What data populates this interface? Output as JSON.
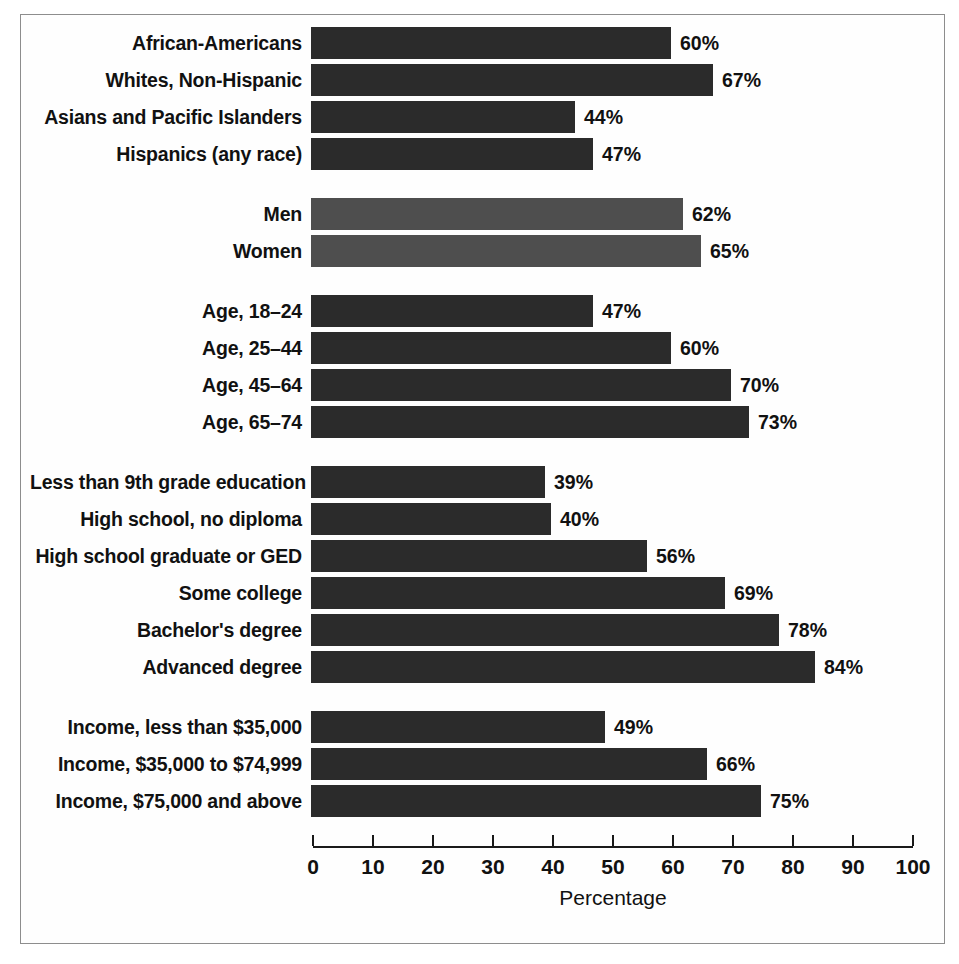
{
  "chart_data": {
    "type": "bar",
    "orientation": "horizontal",
    "title": "",
    "xlabel": "Percentage",
    "ylabel": "",
    "xlim": [
      0,
      100
    ],
    "xticks": [
      0,
      10,
      20,
      30,
      40,
      50,
      60,
      70,
      80,
      90,
      100
    ],
    "xtick_labels": [
      "0",
      "10",
      "20",
      "30",
      "40",
      "50",
      "60",
      "70",
      "80",
      "90",
      "100"
    ],
    "grid": false,
    "legend": null,
    "value_label_suffix": "%",
    "colors": {
      "bar_dark": "#2b2b2b",
      "bar_light": "#4e4e4e",
      "text": "#111111",
      "axis": "#1a1a1a",
      "frame": "#8d8d8d",
      "background": "#ffffff"
    },
    "groups": [
      {
        "name": "race-ethnicity",
        "shade": "dark",
        "categories": [
          "African-Americans",
          "Whites, Non-Hispanic",
          "Asians and Pacific Islanders",
          "Hispanics (any race)"
        ],
        "values": [
          60,
          67,
          44,
          47
        ],
        "value_labels": [
          "60%",
          "67%",
          "44%",
          "47%"
        ]
      },
      {
        "name": "sex",
        "shade": "light",
        "categories": [
          "Men",
          "Women"
        ],
        "values": [
          62,
          65
        ],
        "value_labels": [
          "62%",
          "65%"
        ]
      },
      {
        "name": "age",
        "shade": "dark",
        "categories": [
          "Age, 18–24",
          "Age, 25–44",
          "Age, 45–64",
          "Age, 65–74"
        ],
        "values": [
          47,
          60,
          70,
          73
        ],
        "value_labels": [
          "47%",
          "60%",
          "70%",
          "73%"
        ]
      },
      {
        "name": "education",
        "shade": "dark",
        "categories": [
          "Less than 9th grade education",
          "High school, no diploma",
          "High school graduate or GED",
          "Some college",
          "Bachelor's degree",
          "Advanced degree"
        ],
        "values": [
          39,
          40,
          56,
          69,
          78,
          84
        ],
        "value_labels": [
          "39%",
          "40%",
          "56%",
          "69%",
          "78%",
          "84%"
        ]
      },
      {
        "name": "income",
        "shade": "dark",
        "categories": [
          "Income, less than $35,000",
          "Income, $35,000 to $74,999",
          "Income, $75,000 and above"
        ],
        "values": [
          49,
          66,
          75
        ],
        "value_labels": [
          "49%",
          "66%",
          "75%"
        ]
      }
    ]
  }
}
